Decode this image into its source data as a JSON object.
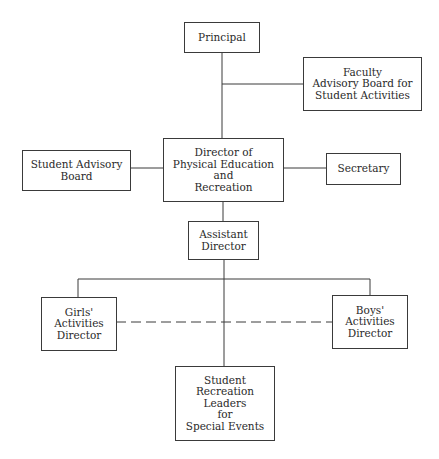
{
  "chart": {
    "type": "organizational-chart",
    "nodes": {
      "principal": "Principal",
      "faculty_board": "Faculty\nAdvisory Board for\nStudent Activities",
      "director": "Director of\nPhysical Education\nand\nRecreation",
      "student_board": "Student Advisory\nBoard",
      "secretary": "Secretary",
      "assistant": "Assistant\nDirector",
      "girls": "Girls'\nActivities\nDirector",
      "boys": "Boys'\nActivities\nDirector",
      "leaders": "Student\nRecreation\nLeaders\nfor\nSpecial Events"
    },
    "edges": [
      {
        "from": "principal",
        "to": "director",
        "style": "solid"
      },
      {
        "from": "principal-director-line",
        "to": "faculty_board",
        "style": "solid"
      },
      {
        "from": "director",
        "to": "student_board",
        "style": "solid"
      },
      {
        "from": "director",
        "to": "secretary",
        "style": "solid"
      },
      {
        "from": "director",
        "to": "assistant",
        "style": "solid"
      },
      {
        "from": "assistant",
        "to": "girls",
        "style": "solid"
      },
      {
        "from": "assistant",
        "to": "boys",
        "style": "solid"
      },
      {
        "from": "assistant",
        "to": "leaders",
        "style": "solid"
      },
      {
        "from": "girls",
        "to": "boys",
        "style": "dashed"
      }
    ],
    "colors": {
      "line": "#3a3a3a",
      "text": "#2a2a2a",
      "background": "#ffffff"
    }
  }
}
